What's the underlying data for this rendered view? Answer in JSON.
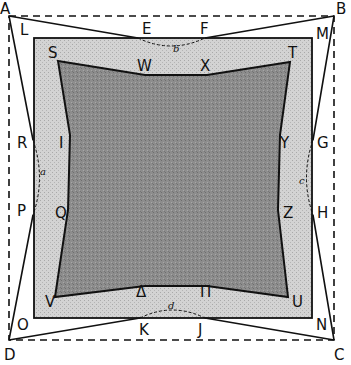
{
  "diagram": {
    "colors": {
      "background": "#ffffff",
      "outer_square_fill": "#d6d6d6",
      "inner_shape_fill": "#8c8c8c",
      "stroke": "#111111"
    },
    "dashed_square": {
      "corners": {
        "A": [
          9,
          16
        ],
        "B": [
          334,
          16
        ],
        "C": [
          334,
          340
        ],
        "D": [
          9,
          340
        ]
      }
    },
    "light_square": {
      "x": 34,
      "y": 38,
      "width": 278,
      "height": 280,
      "corners": {
        "L": "top-left",
        "M": "top-right",
        "N": "bottom-right",
        "O": "bottom-left"
      }
    },
    "inner_shape": {
      "points": "58,61 145,75 207,75 290,62 280,135 278,210 288,297 207,286 145,286 55,297 68,210 70,135"
    },
    "side_lines": "9,16 138,38 M 205,38 334,16 M 334,16 313,140 M 313,215 334,340 M 334,340 205,318 M 140,318 9,340 M 9,340 33,215 M 33,140 9,16",
    "arcs": {
      "b": "M138,38 Q171,54 205,38",
      "c": "M313,140 Q300,178 313,215",
      "d": "M140,318 Q172,302 205,318",
      "a": "M33,140 Q46,178 33,215"
    },
    "labels": [
      {
        "text": "A",
        "x": 0,
        "y": 14
      },
      {
        "text": "B",
        "x": 336,
        "y": 14
      },
      {
        "text": "C",
        "x": 334,
        "y": 360
      },
      {
        "text": "D",
        "x": 4,
        "y": 360
      },
      {
        "text": "L",
        "x": 20,
        "y": 35
      },
      {
        "text": "E",
        "x": 142,
        "y": 34
      },
      {
        "text": "F",
        "x": 200,
        "y": 34
      },
      {
        "text": "M",
        "x": 316,
        "y": 39
      },
      {
        "text": "S",
        "x": 48,
        "y": 58
      },
      {
        "text": "W",
        "x": 137,
        "y": 71
      },
      {
        "text": "X",
        "x": 200,
        "y": 71
      },
      {
        "text": "T",
        "x": 288,
        "y": 58
      },
      {
        "text": "R",
        "x": 17,
        "y": 148
      },
      {
        "text": "I",
        "x": 59,
        "y": 148
      },
      {
        "text": "Y",
        "x": 280,
        "y": 148
      },
      {
        "text": "G",
        "x": 317,
        "y": 148
      },
      {
        "text": "P",
        "x": 17,
        "y": 216
      },
      {
        "text": "Q",
        "x": 55,
        "y": 218
      },
      {
        "text": "Z",
        "x": 283,
        "y": 218
      },
      {
        "text": "H",
        "x": 317,
        "y": 218
      },
      {
        "text": "V",
        "x": 45,
        "y": 307
      },
      {
        "text": "Δ",
        "x": 136,
        "y": 297
      },
      {
        "text": "Π",
        "x": 200,
        "y": 297
      },
      {
        "text": "U",
        "x": 292,
        "y": 307
      },
      {
        "text": "O",
        "x": 17,
        "y": 330
      },
      {
        "text": "K",
        "x": 139,
        "y": 335
      },
      {
        "text": "J",
        "x": 198,
        "y": 335
      },
      {
        "text": "N",
        "x": 316,
        "y": 330
      }
    ],
    "small_labels": [
      {
        "text": "b",
        "x": 173,
        "y": 52
      },
      {
        "text": "a",
        "x": 40,
        "y": 175
      },
      {
        "text": "c",
        "x": 299,
        "y": 184
      },
      {
        "text": "d",
        "x": 168,
        "y": 309
      }
    ]
  }
}
